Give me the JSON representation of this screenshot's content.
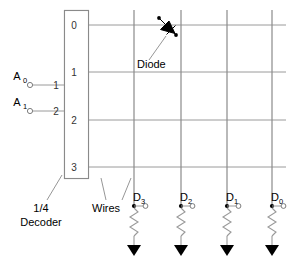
{
  "diagram": {
    "colors": {
      "grid_wire": "#9a9a9a",
      "column_wire": "#8a8a8a",
      "box_outline": "#8a8a8a",
      "text": "#000000",
      "diode": "#000000",
      "background": "#ffffff"
    },
    "decoder": {
      "label_line1": "1/4",
      "label_line2": "Decoder",
      "inputs": [
        {
          "name": "A",
          "subscript": "0",
          "pin": "1"
        },
        {
          "name": "A",
          "subscript": "1",
          "pin": "2"
        }
      ],
      "output_rows": [
        "0",
        "1",
        "2",
        "3"
      ]
    },
    "annotations": [
      {
        "id": "diode-annotation",
        "text": "Diode"
      },
      {
        "id": "wires-annotation",
        "text": "Wires"
      }
    ],
    "outputs": [
      {
        "name": "D",
        "subscript": "3"
      },
      {
        "name": "D",
        "subscript": "2"
      },
      {
        "name": "D",
        "subscript": "1"
      },
      {
        "name": "D",
        "subscript": "0"
      }
    ],
    "devices": [
      {
        "type": "diode",
        "row": "0",
        "column": "D3"
      }
    ]
  }
}
